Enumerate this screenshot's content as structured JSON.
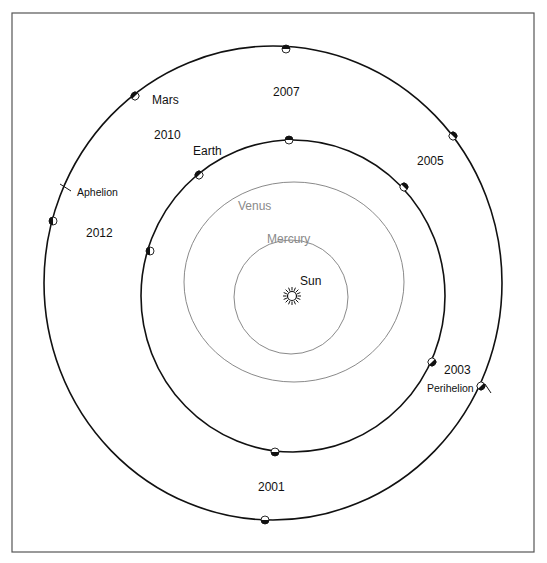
{
  "diagram": {
    "frame": {
      "x": 12,
      "y": 13,
      "width": 522,
      "height": 539,
      "stroke": "#555555"
    },
    "sun": {
      "label": "Sun",
      "cx": 292,
      "cy": 296,
      "label_x": 300,
      "label_y": 285
    },
    "orbits": [
      {
        "name": "Mercury",
        "label": "Mercury",
        "cx": 291,
        "cy": 297,
        "rx": 57,
        "ry": 57,
        "stroke": "#8a8a8a",
        "width": 1,
        "label_x": 267,
        "label_y": 243
      },
      {
        "name": "Venus",
        "label": "Venus",
        "cx": 294,
        "cy": 282,
        "rx": 110,
        "ry": 100,
        "stroke": "#8a8a8a",
        "width": 1,
        "label_x": 238,
        "label_y": 210
      },
      {
        "name": "Earth",
        "label": "Earth",
        "cx": 293,
        "cy": 296,
        "rx": 152,
        "ry": 156,
        "stroke": "#111111",
        "width": 1.6,
        "label_x": 193,
        "label_y": 155
      },
      {
        "name": "Mars",
        "label": "Mars",
        "cx": 273,
        "cy": 283,
        "rx": 229,
        "ry": 237,
        "stroke": "#111111",
        "width": 1.6,
        "label_x": 152,
        "label_y": 104
      }
    ],
    "markers": {
      "earth": [
        {
          "x": 289,
          "y": 140,
          "rot": 0
        },
        {
          "x": 404,
          "y": 187,
          "rot": 45
        },
        {
          "x": 432,
          "y": 362,
          "rot": 135
        },
        {
          "x": 275,
          "y": 452,
          "rot": 180
        },
        {
          "x": 150,
          "y": 251,
          "rot": 270
        },
        {
          "x": 199,
          "y": 175,
          "rot": 315
        }
      ],
      "mars": [
        {
          "x": 286,
          "y": 49,
          "rot": 0
        },
        {
          "x": 453,
          "y": 136,
          "rot": 45
        },
        {
          "x": 481,
          "y": 386,
          "rot": 135
        },
        {
          "x": 265,
          "y": 520,
          "rot": 180
        },
        {
          "x": 53,
          "y": 221,
          "rot": 270
        },
        {
          "x": 135,
          "y": 96,
          "rot": 315
        }
      ]
    },
    "years": [
      {
        "label": "2007",
        "x": 273,
        "y": 96
      },
      {
        "label": "2010",
        "x": 154,
        "y": 139
      },
      {
        "label": "2005",
        "x": 417,
        "y": 165
      },
      {
        "label": "2012",
        "x": 86,
        "y": 237
      },
      {
        "label": "2003",
        "x": 444,
        "y": 374
      },
      {
        "label": "2001",
        "x": 258,
        "y": 491
      }
    ],
    "apsides": {
      "aphelion": {
        "label": "Aphelion",
        "x": 77,
        "y": 196,
        "tick": [
          60,
          184,
          71,
          191
        ]
      },
      "perihelion": {
        "label": "Perihelion",
        "x": 427,
        "y": 392,
        "tick": [
          485,
          384,
          491,
          393
        ]
      }
    },
    "colors": {
      "dark": "#111111",
      "grey": "#8a8a8a",
      "background": "#ffffff"
    }
  }
}
